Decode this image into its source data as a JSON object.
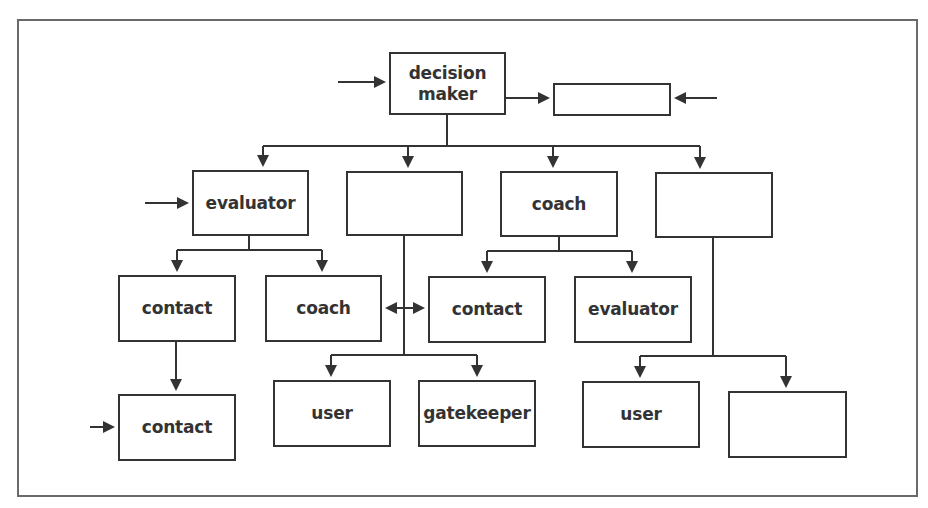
{
  "diagram": {
    "type": "org-chart",
    "colors": {
      "line": "#333333",
      "frame": "#6a6a6a",
      "background": "#ffffff",
      "text": "#333333"
    },
    "frame": {
      "x": 17,
      "y": 19,
      "w": 901,
      "h": 478
    },
    "nodes": [
      {
        "id": "decision-maker",
        "label": "decision maker",
        "x": 389,
        "y": 52,
        "w": 117,
        "h": 63
      },
      {
        "id": "top-right-blank",
        "label": "",
        "x": 553,
        "y": 83,
        "w": 118,
        "h": 33
      },
      {
        "id": "evaluator-l2",
        "label": "evaluator",
        "x": 192,
        "y": 170,
        "w": 117,
        "h": 66
      },
      {
        "id": "blank-l2-a",
        "label": "",
        "x": 346,
        "y": 171,
        "w": 117,
        "h": 65
      },
      {
        "id": "coach-l2",
        "label": "coach",
        "x": 500,
        "y": 171,
        "w": 118,
        "h": 66
      },
      {
        "id": "blank-l2-b",
        "label": "",
        "x": 655,
        "y": 172,
        "w": 118,
        "h": 66
      },
      {
        "id": "contact-l3-left",
        "label": "contact",
        "x": 118,
        "y": 275,
        "w": 118,
        "h": 67
      },
      {
        "id": "coach-l3",
        "label": "coach",
        "x": 265,
        "y": 275,
        "w": 117,
        "h": 67
      },
      {
        "id": "contact-l3-right",
        "label": "contact",
        "x": 428,
        "y": 276,
        "w": 118,
        "h": 67
      },
      {
        "id": "evaluator-l3",
        "label": "evaluator",
        "x": 574,
        "y": 276,
        "w": 118,
        "h": 67
      },
      {
        "id": "contact-l4",
        "label": "contact",
        "x": 118,
        "y": 394,
        "w": 118,
        "h": 67
      },
      {
        "id": "user-l4-left",
        "label": "user",
        "x": 273,
        "y": 380,
        "w": 118,
        "h": 67
      },
      {
        "id": "gatekeeper-l4",
        "label": "gatekeeper",
        "x": 418,
        "y": 380,
        "w": 118,
        "h": 67
      },
      {
        "id": "user-l4-right",
        "label": "user",
        "x": 582,
        "y": 381,
        "w": 118,
        "h": 67
      },
      {
        "id": "blank-l4",
        "label": "",
        "x": 728,
        "y": 391,
        "w": 119,
        "h": 67
      }
    ],
    "lines": [
      {
        "pts": [
          [
            447,
            115
          ],
          [
            447,
            146
          ]
        ]
      },
      {
        "pts": [
          [
            263,
            146
          ],
          [
            700,
            146
          ]
        ]
      },
      {
        "pts": [
          [
            263,
            146
          ],
          [
            263,
            167
          ]
        ],
        "arrow": "end"
      },
      {
        "pts": [
          [
            408,
            146
          ],
          [
            408,
            168
          ]
        ],
        "arrow": "end"
      },
      {
        "pts": [
          [
            553,
            146
          ],
          [
            553,
            168
          ]
        ],
        "arrow": "end"
      },
      {
        "pts": [
          [
            700,
            146
          ],
          [
            700,
            169
          ]
        ],
        "arrow": "end"
      },
      {
        "pts": [
          [
            338,
            82
          ],
          [
            386,
            82
          ]
        ],
        "arrow": "end"
      },
      {
        "pts": [
          [
            506,
            98
          ],
          [
            550,
            98
          ]
        ],
        "arrow": "end"
      },
      {
        "pts": [
          [
            717,
            98
          ],
          [
            674,
            98
          ]
        ],
        "arrow": "end"
      },
      {
        "pts": [
          [
            145,
            203
          ],
          [
            189,
            203
          ]
        ],
        "arrow": "end"
      },
      {
        "pts": [
          [
            249,
            236
          ],
          [
            249,
            250
          ]
        ]
      },
      {
        "pts": [
          [
            177,
            250
          ],
          [
            322,
            250
          ]
        ]
      },
      {
        "pts": [
          [
            177,
            250
          ],
          [
            177,
            272
          ]
        ],
        "arrow": "end"
      },
      {
        "pts": [
          [
            322,
            250
          ],
          [
            322,
            272
          ]
        ],
        "arrow": "end"
      },
      {
        "pts": [
          [
            559,
            237
          ],
          [
            559,
            251
          ]
        ]
      },
      {
        "pts": [
          [
            487,
            251
          ],
          [
            632,
            251
          ]
        ]
      },
      {
        "pts": [
          [
            487,
            251
          ],
          [
            487,
            273
          ]
        ],
        "arrow": "end"
      },
      {
        "pts": [
          [
            632,
            251
          ],
          [
            632,
            273
          ]
        ],
        "arrow": "end"
      },
      {
        "pts": [
          [
            404,
            236
          ],
          [
            404,
            355
          ]
        ]
      },
      {
        "pts": [
          [
            404,
            308
          ],
          [
            385,
            308
          ]
        ],
        "arrow": "end"
      },
      {
        "pts": [
          [
            404,
            308
          ],
          [
            425,
            308
          ]
        ],
        "arrow": "end"
      },
      {
        "pts": [
          [
            331,
            355
          ],
          [
            477,
            355
          ]
        ]
      },
      {
        "pts": [
          [
            331,
            355
          ],
          [
            331,
            377
          ]
        ],
        "arrow": "end"
      },
      {
        "pts": [
          [
            477,
            355
          ],
          [
            477,
            377
          ]
        ],
        "arrow": "end"
      },
      {
        "pts": [
          [
            713,
            238
          ],
          [
            713,
            356
          ]
        ]
      },
      {
        "pts": [
          [
            640,
            356
          ],
          [
            786,
            356
          ]
        ]
      },
      {
        "pts": [
          [
            640,
            356
          ],
          [
            640,
            378
          ]
        ],
        "arrow": "end"
      },
      {
        "pts": [
          [
            786,
            356
          ],
          [
            786,
            388
          ]
        ],
        "arrow": "end"
      },
      {
        "pts": [
          [
            176,
            342
          ],
          [
            176,
            391
          ]
        ],
        "arrow": "end"
      },
      {
        "pts": [
          [
            90,
            427
          ],
          [
            115,
            427
          ]
        ],
        "arrow": "end"
      }
    ]
  }
}
